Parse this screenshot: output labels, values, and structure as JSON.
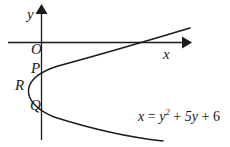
{
  "figure": {
    "type": "cartesian-graph",
    "background_color": "#ffffff",
    "stroke_color": "#1a1a1a",
    "axes": {
      "x_axis_label": "x",
      "y_axis_label": "y",
      "origin_label": "O"
    },
    "curve": {
      "name": "parabola",
      "equation_plain": "x = y^2 + 5y + 6",
      "equation_parts": {
        "lhs": "x",
        "equals": "=",
        "var": "y",
        "exponent": "2",
        "plus1": "+",
        "linear_term": "5y",
        "plus2": "+",
        "constant": "6"
      },
      "opens": "right"
    },
    "points": [
      {
        "label": "P",
        "description": "upper y-intercept"
      },
      {
        "label": "R",
        "description": "vertex"
      },
      {
        "label": "Q",
        "description": "lower y-intercept"
      }
    ]
  }
}
